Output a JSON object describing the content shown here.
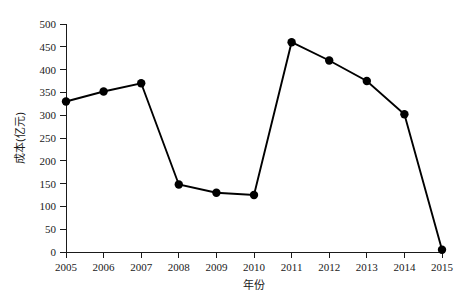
{
  "chart_data": {
    "type": "line",
    "title": "",
    "xlabel": "年份",
    "ylabel": "成本(亿元)",
    "categories": [
      "2005",
      "2006",
      "2007",
      "2008",
      "2009",
      "2010",
      "2011",
      "2012",
      "2013",
      "2014",
      "2015"
    ],
    "x": [
      2005,
      2006,
      2007,
      2008,
      2009,
      2010,
      2011,
      2012,
      2013,
      2014,
      2015
    ],
    "values": [
      330,
      352,
      370,
      148,
      130,
      125,
      460,
      420,
      375,
      302,
      5
    ],
    "series": [
      {
        "name": "成本(亿元)",
        "values": [
          330,
          352,
          370,
          148,
          130,
          125,
          460,
          420,
          375,
          302,
          5
        ],
        "color": "#000000",
        "marker": "filled-circle"
      }
    ],
    "xlim": [
      2005,
      2015
    ],
    "ylim": [
      0,
      500
    ],
    "yticks": [
      0,
      50,
      100,
      150,
      200,
      250,
      300,
      350,
      400,
      450,
      500
    ],
    "ytick_labels": [
      "0",
      "50",
      "100",
      "150",
      "200",
      "250",
      "300",
      "350",
      "400",
      "450",
      "500"
    ],
    "xticks": [
      2005,
      2006,
      2007,
      2008,
      2009,
      2010,
      2011,
      2012,
      2013,
      2014,
      2015
    ],
    "xtick_labels": [
      "2005",
      "2006",
      "2007",
      "2008",
      "2009",
      "2010",
      "2011",
      "2012",
      "2013",
      "2014",
      "2015"
    ],
    "grid": false,
    "legend": false,
    "legend_position": "none",
    "background_color": "#ffffff",
    "axis_color": "#1a1a1a"
  }
}
